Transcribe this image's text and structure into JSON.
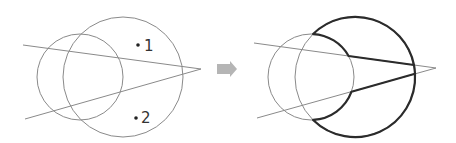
{
  "diagram": {
    "left_panel": {
      "points": [
        {
          "label": "1",
          "x": 138,
          "y": 45
        },
        {
          "label": "2",
          "x": 136,
          "y": 118
        }
      ]
    },
    "arrow": {
      "direction": "right",
      "color": "#b5b5b5"
    },
    "right_panel": {
      "highlight_color": "#2b2b2b"
    },
    "colors": {
      "thin_stroke": "#8a8a8a",
      "bold_stroke": "#2b2b2b",
      "background": "#ffffff"
    }
  }
}
